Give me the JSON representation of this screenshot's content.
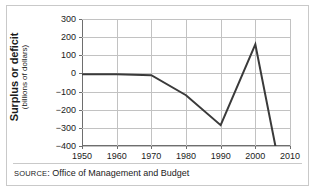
{
  "chart_data": {
    "type": "line",
    "title": "",
    "xlabel": "",
    "ylabel": "Surplus or deficit",
    "ylabel_sub": "(billions of dollars)",
    "xlim": [
      1950,
      2010
    ],
    "ylim": [
      -400,
      300
    ],
    "grid": true,
    "legend": "none",
    "x": [
      1950,
      1960,
      1970,
      1980,
      1990,
      2000,
      2006
    ],
    "values": [
      -5,
      -5,
      -10,
      -120,
      -285,
      160,
      -420
    ],
    "series": [
      {
        "name": "Surplus or deficit",
        "values": [
          -5,
          -5,
          -10,
          -120,
          -285,
          160,
          -420
        ]
      }
    ],
    "xticks": [
      1950,
      1960,
      1970,
      1980,
      1990,
      2000,
      2010
    ],
    "xtick_labels": [
      "1950",
      "1960",
      "1970",
      "1980",
      "1990",
      "2000",
      "2010"
    ],
    "yticks": [
      300,
      200,
      100,
      0,
      -100,
      -200,
      -300,
      -400
    ],
    "ytick_labels": [
      "300",
      "200",
      "100",
      "0",
      "−100",
      "−200",
      "−300",
      "−400"
    ],
    "line_color": "#3a3a3a",
    "grid_color": "#c2c2c2",
    "axis_color": "#6e6e6e"
  },
  "source": {
    "label": "SOURCE",
    "separator": ": ",
    "text": "Office of Management and Budget"
  }
}
